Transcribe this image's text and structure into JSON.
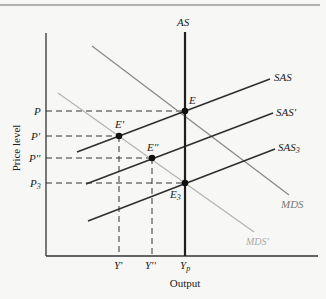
{
  "figure": {
    "y_axis_title": "Price level",
    "x_axis_title": "Output",
    "curves": {
      "as": {
        "label": "AS",
        "x": 185,
        "y1": 32,
        "y2": 256
      },
      "sas": {
        "label": "SAS",
        "x1": 77,
        "y1": 152,
        "x2": 270,
        "y2": 79
      },
      "sas_prime": {
        "label": "SAS'",
        "x1": 86,
        "y1": 184,
        "x2": 273,
        "y2": 113
      },
      "sas3": {
        "label": "SAS",
        "sub": "3",
        "x1": 88,
        "y1": 221,
        "x2": 275,
        "y2": 149
      },
      "mds": {
        "label": "MDS",
        "x1": 92,
        "y1": 46,
        "x2": 289,
        "y2": 195
      },
      "mds_prime": {
        "label": "MDS'",
        "x1": 58,
        "y1": 93,
        "x2": 254,
        "y2": 232
      }
    },
    "equilibria": [
      {
        "label": "E",
        "x": 185,
        "y": 111
      },
      {
        "label": "E'",
        "x": 119,
        "y": 136
      },
      {
        "label": "E''",
        "x": 152,
        "y": 158
      },
      {
        "label": "E",
        "sub": "3",
        "x": 185,
        "y": 183
      }
    ],
    "price_ticks": [
      {
        "label": "P",
        "y": 111
      },
      {
        "label": "P'",
        "y": 136
      },
      {
        "label": "P''",
        "y": 158
      },
      {
        "label": "P",
        "sub": "3",
        "y": 183
      }
    ],
    "output_ticks": [
      {
        "label": "Y'",
        "x": 119
      },
      {
        "label": "Y''",
        "x": 152
      },
      {
        "label": "Y",
        "sub": "p",
        "x": 185
      }
    ],
    "colors": {
      "dark": "#2a2a2a",
      "mid": "#8a8a8a",
      "light": "#b5b5b5",
      "background": "#f7f7f5"
    }
  }
}
